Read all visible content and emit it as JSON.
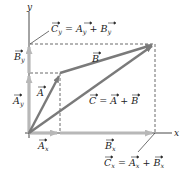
{
  "diagram": {
    "axes": {
      "x_label": "x",
      "y_label": "y"
    },
    "vectors": {
      "A": {
        "label": "A",
        "from": [
          29,
          133
        ],
        "to": [
          60,
          73
        ]
      },
      "B": {
        "label": "B",
        "from": [
          60,
          73
        ],
        "to": [
          155,
          44
        ]
      },
      "C": {
        "label": "C",
        "equation": "= A + B",
        "from": [
          29,
          133
        ],
        "to": [
          155,
          44
        ]
      },
      "Ax": {
        "label": "A",
        "sub": "x"
      },
      "Ay": {
        "label": "A",
        "sub": "y"
      },
      "Bx": {
        "label": "B",
        "sub": "x"
      },
      "By": {
        "label": "B",
        "sub": "y"
      }
    },
    "annotations": {
      "cy": {
        "lhs": "C",
        "lhs_sub": "y",
        "eq": " = ",
        "t1": "A",
        "t1_sub": "y",
        "plus": " + ",
        "t2": "B",
        "t2_sub": "y"
      },
      "cx": {
        "lhs": "C",
        "lhs_sub": "x",
        "eq": " = ",
        "t1": "A",
        "t1_sub": "x",
        "plus": " + ",
        "t2": "B",
        "t2_sub": "x"
      },
      "c_eq": {
        "c": "C",
        "eq": " = ",
        "a": "A",
        "plus": " + ",
        "b": "B"
      }
    },
    "colors": {
      "vector": "#7a7a7a",
      "component": "#b8b8b8",
      "axis": "#333333",
      "dashed": "#444444",
      "text": "#222222"
    }
  }
}
